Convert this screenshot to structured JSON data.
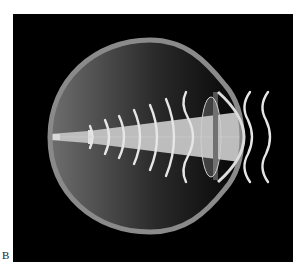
{
  "figure": {
    "panel_label": "B",
    "colors": {
      "background": "#000000",
      "sclera": "#8a8a8a",
      "vitreous_light": "#6e6e6e",
      "beam": "#bdbdbd",
      "wavefront": "#e6e6e6"
    },
    "wavefront_count_inside": 7,
    "wavefront_count_outside": 2
  }
}
